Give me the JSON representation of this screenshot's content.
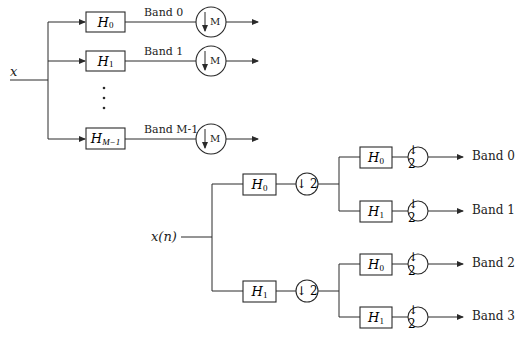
{
  "top_diagram": {
    "input_label": "x",
    "branches": [
      {
        "filter": "H",
        "subscript": "0",
        "band_label": "Band 0",
        "decimator": "M"
      },
      {
        "filter": "H",
        "subscript": "1",
        "band_label": "Band 1",
        "decimator": "M"
      },
      {
        "filter": "H",
        "subscript": "M−1",
        "band_label": "Band M-1",
        "decimator": "M"
      }
    ],
    "ellipsis": "⋮",
    "downsample_arrow": "↓"
  },
  "bottom_diagram": {
    "input_label": "x(n)",
    "stage1": [
      {
        "filter": "H",
        "subscript": "0",
        "decimator": "↓ 2"
      },
      {
        "filter": "H",
        "subscript": "1",
        "decimator": "↓ 2"
      }
    ],
    "stage2": [
      {
        "filter": "H",
        "subscript": "0",
        "decimator": "↓ 2",
        "band_label": "Band 0"
      },
      {
        "filter": "H",
        "subscript": "1",
        "decimator": "↓ 2",
        "band_label": "Band 1"
      },
      {
        "filter": "H",
        "subscript": "0",
        "decimator": "↓ 2",
        "band_label": "Band 2"
      },
      {
        "filter": "H",
        "subscript": "1",
        "decimator": "↓ 2",
        "band_label": "Band 3"
      }
    ]
  },
  "colors": {
    "line": "#2a2a2a",
    "background": "#ffffff",
    "text": "#222222"
  }
}
